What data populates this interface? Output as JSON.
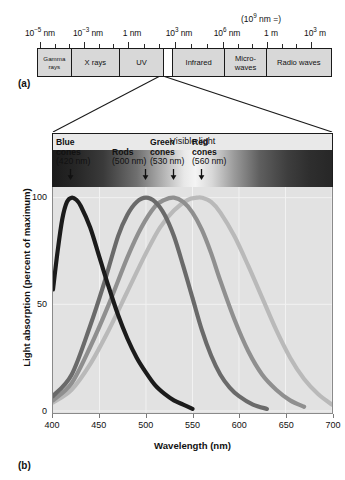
{
  "figure": {
    "panel_a_label": "(a)",
    "panel_b_label": "(b)"
  },
  "em_spectrum": {
    "scale_labels": [
      {
        "text_html": "10<sup>−5</sup> nm",
        "plain": "10^-5 nm",
        "x": 40
      },
      {
        "text_html": "10<sup>−3</sup> nm",
        "plain": "10^-3 nm",
        "x": 88
      },
      {
        "text_html": "1 nm",
        "plain": "1 nm",
        "x": 132
      },
      {
        "text_html": "10<sup>3</sup> nm",
        "plain": "10^3 nm",
        "x": 179
      },
      {
        "text_html": "10<sup>6</sup> nm",
        "plain": "10^6 nm",
        "x": 227
      },
      {
        "text_html": "1 m",
        "plain": "1 m",
        "x": 271
      },
      {
        "text_html": "10<sup>3</sup> m",
        "plain": "10^3 m",
        "x": 315
      }
    ],
    "paren_note_html": "(10<sup>9</sup> nm =)",
    "paren_note_plain": "(10^9 nm =)",
    "bands": [
      {
        "label": "Gamma rays",
        "width_pct": 11.5,
        "kind": "gamma"
      },
      {
        "label": "X rays",
        "width_pct": 16.5,
        "kind": "normal"
      },
      {
        "label": "UV",
        "width_pct": 15.0,
        "kind": "normal"
      },
      {
        "label": "Visible light",
        "width_pct": 3.0,
        "kind": "visible-gap"
      },
      {
        "label": "Infrared",
        "width_pct": 18.0,
        "kind": "normal"
      },
      {
        "label": "Micro- waves",
        "width_pct": 14.0,
        "kind": "normal"
      },
      {
        "label": "Radio waves",
        "width_pct": 22.0,
        "kind": "normal"
      }
    ]
  },
  "visible_light": {
    "caption": "Visible light"
  },
  "chart_data": {
    "type": "line",
    "title": "",
    "xlabel": "Wavelength (nm)",
    "ylabel": "Light absorption (percent of maximum)",
    "xlim": [
      400,
      700
    ],
    "ylim": [
      0,
      105
    ],
    "xticks": [
      400,
      450,
      500,
      550,
      600,
      650,
      700
    ],
    "yticks": [
      0,
      50,
      100
    ],
    "xtick_labels": [
      "400",
      "450",
      "500",
      "550",
      "600",
      "650",
      "700"
    ],
    "ytick_labels": [
      "0",
      "50",
      "100"
    ],
    "grid": true,
    "legend_position": "in-plot-annotations",
    "series": [
      {
        "name": "Blue cones",
        "peak_nm": 420,
        "peak_label": "(420 nm)",
        "color": "#1b1b1b",
        "x": [
          400,
          405,
          410,
          415,
          420,
          425,
          430,
          440,
          450,
          460,
          470,
          480,
          490,
          500,
          510,
          520,
          530,
          540,
          550
        ],
        "values": [
          57,
          75,
          90,
          98,
          100,
          99,
          96,
          86,
          72,
          58,
          45,
          34,
          25,
          18,
          12,
          8,
          5,
          3,
          1
        ]
      },
      {
        "name": "Rods",
        "peak_nm": 500,
        "peak_label": "(500 nm)",
        "color": "#6a6a6a",
        "x": [
          400,
          420,
          440,
          455,
          470,
          480,
          490,
          500,
          510,
          520,
          530,
          540,
          550,
          560,
          570,
          580,
          590,
          600,
          615,
          630
        ],
        "values": [
          7,
          17,
          40,
          60,
          82,
          92,
          98,
          100,
          98,
          92,
          82,
          68,
          53,
          38,
          26,
          17,
          11,
          7,
          3,
          1
        ]
      },
      {
        "name": "Green cones",
        "peak_nm": 530,
        "peak_label": "(530 nm)",
        "color": "#8f8f8f",
        "x": [
          400,
          420,
          440,
          460,
          480,
          495,
          510,
          520,
          530,
          540,
          550,
          560,
          570,
          580,
          595,
          610,
          625,
          640,
          655,
          670
        ],
        "values": [
          5,
          13,
          30,
          50,
          72,
          86,
          96,
          99,
          100,
          98,
          93,
          85,
          74,
          61,
          43,
          28,
          17,
          10,
          5,
          2
        ]
      },
      {
        "name": "Red cones",
        "peak_nm": 560,
        "peak_label": "(560 nm)",
        "color": "#b9b9b9",
        "x": [
          400,
          420,
          440,
          460,
          480,
          500,
          515,
          530,
          545,
          555,
          560,
          570,
          580,
          595,
          610,
          625,
          640,
          655,
          670,
          685,
          700
        ],
        "values": [
          4,
          10,
          22,
          38,
          56,
          74,
          86,
          94,
          99,
          100,
          100,
          98,
          93,
          82,
          68,
          53,
          38,
          25,
          15,
          8,
          3
        ]
      }
    ],
    "annotations": [
      {
        "name": "Blue",
        "second_line": "cones",
        "wavelength": "(420 nm)"
      },
      {
        "name": "Rods",
        "second_line": "",
        "wavelength": "(500 nm)"
      },
      {
        "name": "Green",
        "second_line": "cones",
        "wavelength": "(530 nm)"
      },
      {
        "name": "Red",
        "second_line": "cones",
        "wavelength": "(560 nm)"
      }
    ]
  }
}
